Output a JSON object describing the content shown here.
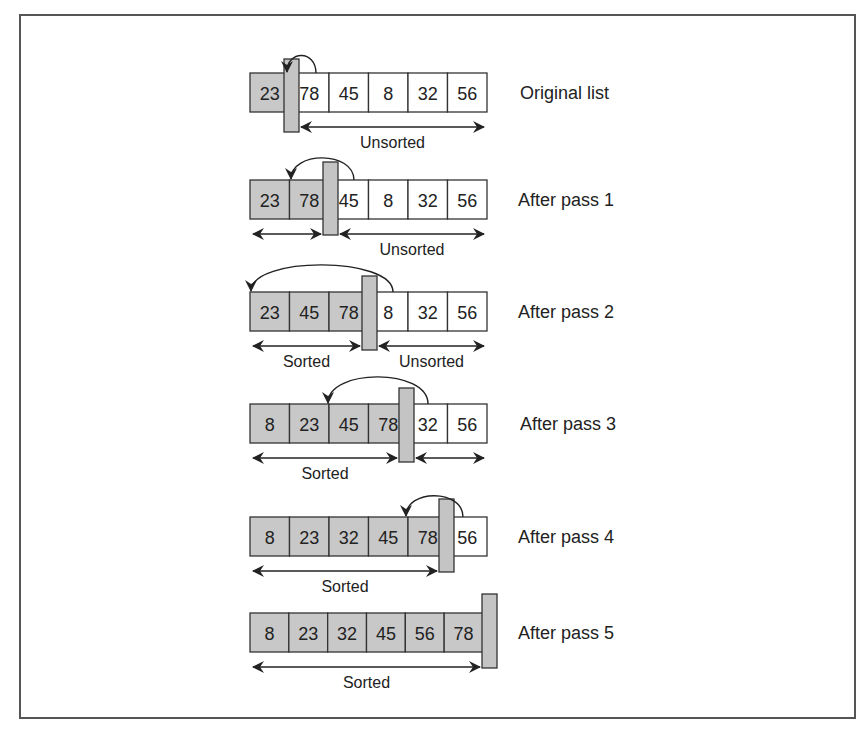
{
  "diagram": {
    "type": "insertion-sort-passes",
    "colors": {
      "sorted_fill": "#c8c8c8",
      "unsorted_fill": "#ffffff",
      "divider_fill": "#c4c4c4",
      "stroke": "#333333",
      "frame": "#555555"
    },
    "rows": [
      {
        "label": "Original list",
        "values": [
          "23",
          "78",
          "45",
          "8",
          "32",
          "56"
        ],
        "sorted_count": 1,
        "spans": [
          {
            "text": "Unsorted",
            "from": 1,
            "to": 6
          }
        ]
      },
      {
        "label": "After pass 1",
        "values": [
          "23",
          "78",
          "45",
          "8",
          "32",
          "56"
        ],
        "sorted_count": 2,
        "spans": [
          {
            "text": "",
            "from": 0,
            "to": 2
          },
          {
            "text": "Unsorted",
            "from": 2,
            "to": 6
          }
        ]
      },
      {
        "label": "After pass 2",
        "values": [
          "23",
          "45",
          "78",
          "8",
          "32",
          "56"
        ],
        "sorted_count": 3,
        "spans": [
          {
            "text": "Sorted",
            "from": 0,
            "to": 3
          },
          {
            "text": "Unsorted",
            "from": 3,
            "to": 6
          }
        ]
      },
      {
        "label": "After pass 3",
        "values": [
          "8",
          "23",
          "45",
          "78",
          "32",
          "56"
        ],
        "sorted_count": 4,
        "spans": [
          {
            "text": "Sorted",
            "from": 0,
            "to": 4
          },
          {
            "text": "",
            "from": 4,
            "to": 6
          }
        ]
      },
      {
        "label": "After pass 4",
        "values": [
          "8",
          "23",
          "32",
          "45",
          "78",
          "56"
        ],
        "sorted_count": 5,
        "spans": [
          {
            "text": "Sorted",
            "from": 0,
            "to": 5
          }
        ]
      },
      {
        "label": "After pass 5",
        "values": [
          "8",
          "23",
          "32",
          "45",
          "56",
          "78"
        ],
        "sorted_count": 6,
        "spans": [
          {
            "text": "Sorted",
            "from": 0,
            "to": 6
          }
        ]
      }
    ]
  }
}
